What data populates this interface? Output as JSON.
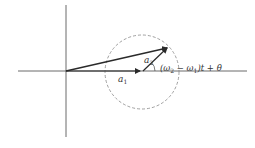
{
  "diagram": {
    "type": "phasor-diagram",
    "labels": {
      "a1": {
        "base": "a",
        "sub": "1"
      },
      "a2": {
        "base": "a",
        "sub": "2"
      },
      "angle_prefix": "(ω",
      "angle_sub2": "2",
      "angle_mid": " − ω",
      "angle_sub1": "1",
      "angle_suffix": ")t + θ"
    },
    "colors": {
      "axis": "#444444",
      "vector": "#2a2a2a",
      "circle": "#888888",
      "text": "#333333"
    },
    "geometry": {
      "origin": [
        66,
        71
      ],
      "a1_tip": [
        140,
        71
      ],
      "a2_tip": [
        168,
        47
      ],
      "circle_center": [
        142,
        72
      ],
      "circle_radius": 37
    }
  }
}
